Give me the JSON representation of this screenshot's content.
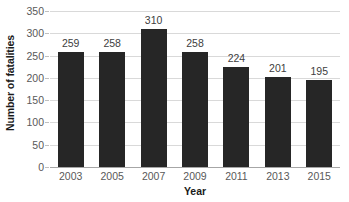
{
  "chart_data": {
    "type": "bar",
    "title": "",
    "subtitle": "",
    "xlabel": "Year",
    "ylabel": "Number of fatalities",
    "categories": [
      "2003",
      "2005",
      "2007",
      "2009",
      "2011",
      "2013",
      "2015"
    ],
    "values": [
      259,
      258,
      310,
      258,
      224,
      201,
      195
    ],
    "data_labels": [
      "259",
      "258",
      "310",
      "258",
      "224",
      "201",
      "195"
    ],
    "ylim": [
      0,
      350
    ],
    "ytick_values": [
      0,
      50,
      100,
      150,
      200,
      250,
      300,
      350
    ],
    "ytick_labels": [
      "0",
      "50",
      "100",
      "150",
      "200",
      "250",
      "300",
      "350"
    ],
    "grid": true,
    "grid_axis": "y",
    "legend": false,
    "legend_position": "none",
    "bar_color": "#262626",
    "gridline_color": "#d9d9d9",
    "axis_line_color": "#a6a6a6",
    "tick_label_color": "#595959",
    "data_label_color": "#404040",
    "axis_title_color": "#1a1a1a",
    "background_color": "#ffffff"
  }
}
